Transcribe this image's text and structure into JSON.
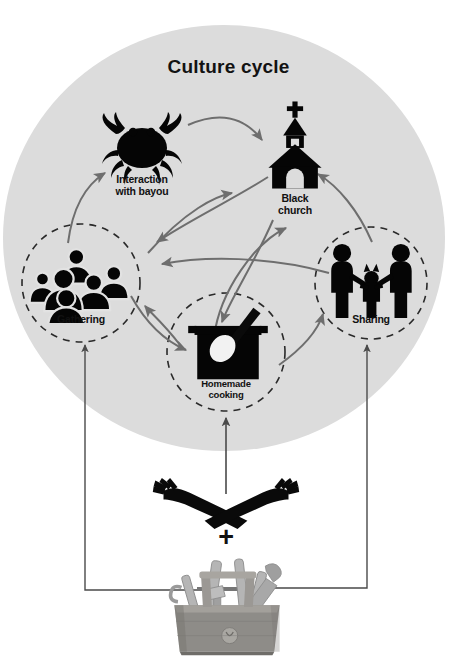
{
  "diagram": {
    "title": "Culture cycle",
    "type": "cycle-diagram",
    "background_color": "#ffffff",
    "circle_fill": "#dcdcdc",
    "arrow_color": "#6e6e6e",
    "line_color": "#555555",
    "icon_color": "#000000",
    "nodes": [
      {
        "id": "interaction",
        "label_line1": "Interaction",
        "label_line2": "with bayou",
        "icon": "crab-icon",
        "dashed_circle": false
      },
      {
        "id": "church",
        "label_line1": "Black",
        "label_line2": "church",
        "icon": "church-icon",
        "dashed_circle": false
      },
      {
        "id": "gathering",
        "label_line1": "Gathering",
        "label_line2": "",
        "icon": "crowd-icon",
        "dashed_circle": true
      },
      {
        "id": "cooking",
        "label_line1": "Homemade",
        "label_line2": "cooking",
        "icon": "pot-spoon-icon",
        "dashed_circle": true
      },
      {
        "id": "sharing",
        "label_line1": "Sharing",
        "label_line2": "",
        "icon": "family-icon",
        "dashed_circle": true
      }
    ],
    "inputs": [
      {
        "id": "hands",
        "icon": "crossed-hands-icon",
        "label": ""
      },
      {
        "id": "plus",
        "icon": "plus-sign",
        "label": "+"
      },
      {
        "id": "toolbox",
        "icon": "toolbox-icon",
        "label": ""
      }
    ],
    "connections": [
      {
        "from": "interaction",
        "to": "church",
        "style": "curved-arrow"
      },
      {
        "from": "church",
        "to": "gathering",
        "style": "curved-arrow"
      },
      {
        "from": "gathering",
        "to": "interaction",
        "style": "curved-arrow"
      },
      {
        "from": "gathering",
        "to": "church",
        "style": "curved-arrow"
      },
      {
        "from": "gathering",
        "to": "cooking",
        "style": "curved-arrow"
      },
      {
        "from": "cooking",
        "to": "gathering",
        "style": "curved-arrow"
      },
      {
        "from": "cooking",
        "to": "church",
        "style": "curved-arrow"
      },
      {
        "from": "church",
        "to": "cooking",
        "style": "curved-arrow"
      },
      {
        "from": "cooking",
        "to": "sharing",
        "style": "curved-arrow"
      },
      {
        "from": "sharing",
        "to": "church",
        "style": "curved-arrow"
      },
      {
        "from": "sharing",
        "to": "gathering",
        "style": "curved-arrow"
      },
      {
        "from": "toolbox",
        "to": "gathering",
        "style": "elbow-line-arrow"
      },
      {
        "from": "toolbox",
        "to": "sharing",
        "style": "elbow-line-arrow"
      },
      {
        "from": "hands",
        "to": "cooking",
        "style": "straight-line-arrow"
      }
    ]
  }
}
